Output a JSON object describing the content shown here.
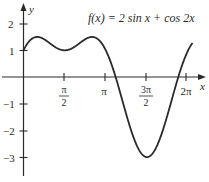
{
  "chart_data": {
    "type": "line",
    "title": "f(x) = 2 sin x + cos 2x",
    "xlabel": "x",
    "ylabel": "y",
    "x_ticks": [
      {
        "value": 1.5708,
        "label_num": "π",
        "label_den": "2"
      },
      {
        "value": 3.1416,
        "label": "π"
      },
      {
        "value": 4.7124,
        "label_num": "3π",
        "label_den": "2"
      },
      {
        "value": 6.2832,
        "label": "2π"
      }
    ],
    "y_ticks": [
      {
        "value": 2,
        "label": "2"
      },
      {
        "value": 1,
        "label": "1"
      },
      {
        "value": -1,
        "label": "−1"
      },
      {
        "value": -2,
        "label": "−2"
      },
      {
        "value": -3,
        "label": "−3"
      }
    ],
    "xlim": [
      0,
      6.5
    ],
    "ylim": [
      -3.5,
      2.6
    ],
    "grid": false,
    "legend": "none",
    "series": [
      {
        "name": "f(x) = 2 sin x + cos 2x",
        "x": [
          0,
          0.5236,
          1.5708,
          2.618,
          3.1416,
          3.6652,
          4.1888,
          4.7124,
          5.236,
          5.7596,
          6.2832,
          6.5
        ],
        "y": [
          1,
          1.5,
          1,
          1.5,
          1,
          0,
          -1.232,
          -3,
          -1.232,
          0,
          1,
          1.34
        ]
      }
    ],
    "key_points": {
      "local_max_1": {
        "x": 0.5236,
        "y": 1.5
      },
      "local_min_1": {
        "x": 1.5708,
        "y": 1
      },
      "local_max_2": {
        "x": 2.618,
        "y": 1.5
      },
      "global_min": {
        "x": 4.7124,
        "y": -3
      }
    }
  },
  "labels": {
    "formula": "f(x) = 2 sin x + cos 2x",
    "x_axis": "x",
    "y_axis": "y",
    "x_tick_pi_half_num": "π",
    "x_tick_pi_half_den": "2",
    "x_tick_pi": "π",
    "x_tick_3pi_half_num": "3π",
    "x_tick_3pi_half_den": "2",
    "x_tick_2pi": "2π",
    "y_tick_2": "2",
    "y_tick_1": "1",
    "y_tick_m1": "−1",
    "y_tick_m2": "−2",
    "y_tick_m3": "−3"
  },
  "colors": {
    "curve": "#2a2a2a",
    "axes": "#2a2a2a",
    "background": "#ffffff"
  }
}
